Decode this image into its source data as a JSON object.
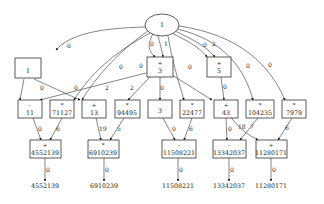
{
  "diagram": {
    "type": "computation-graph",
    "root": {
      "label": "1",
      "shape": "ellipse"
    },
    "level1": [
      {
        "id": "n1",
        "op": "",
        "value": "1"
      },
      {
        "id": "n3",
        "op": "+",
        "value": "3"
      },
      {
        "id": "n5",
        "op": "+",
        "value": "5"
      }
    ],
    "level2": [
      {
        "id": "n11",
        "op": "-",
        "value": "11"
      },
      {
        "id": "n71127",
        "op": "*",
        "value": "71127"
      },
      {
        "id": "n13",
        "op": "+",
        "value": "13"
      },
      {
        "id": "n94495",
        "op": "*",
        "value": "94495"
      },
      {
        "id": "n3b",
        "op": "",
        "value": "3"
      },
      {
        "id": "n22477",
        "op": "*",
        "value": "22477"
      },
      {
        "id": "n43",
        "op": "+",
        "value": "43"
      },
      {
        "id": "n104235",
        "op": "*",
        "value": "104235"
      },
      {
        "id": "n7979",
        "op": "*",
        "value": "7979"
      }
    ],
    "level3": [
      {
        "id": "n4552139",
        "op": "+",
        "value": "4552139"
      },
      {
        "id": "n6910239",
        "op": "*",
        "value": "6910239"
      },
      {
        "id": "n11508221",
        "op": "-",
        "value": "11508221"
      },
      {
        "id": "n13342037",
        "op": "-",
        "value": "13342037"
      },
      {
        "id": "n11280171",
        "op": "+",
        "value": "11280171"
      }
    ],
    "outputs": [
      "4552139",
      "6910239",
      "11508221",
      "13342037",
      "11280171"
    ],
    "edge_labels": {
      "root_to_n1": "0",
      "root_to_n3_a": "0",
      "root_to_n3_b": "1",
      "root_to_n5_a": "0",
      "root_to_n5_b": "2",
      "root_to_n13": "0",
      "root_to_n71127": "0",
      "root_to_n22477": "0",
      "root_to_n104235": "0",
      "root_to_n7979": "0",
      "n1_to_n11": "0",
      "n1_to_n4552139": "0",
      "n3_to_n11": "2",
      "n3_to_n94495": "2",
      "n3_to_n43": "0",
      "n5_to_n11280171": "0",
      "n11_to_n4552139": "0",
      "n71127_to_n4552139": "6",
      "n13_to_n6910239": "19",
      "n94495_to_n6910239": "5",
      "n3b_to_n11508221": "0",
      "n22477_to_n11508221": "6",
      "n43_to_n13342037": "0",
      "n43_to_n11280171": "18",
      "n104235_to_n13342037": "7",
      "n7979_to_n11280171": "6",
      "out_4552139": "0",
      "out_6910239": "0",
      "out_11508221": "0",
      "out_13342037": "0",
      "out_11280171": "0"
    }
  }
}
